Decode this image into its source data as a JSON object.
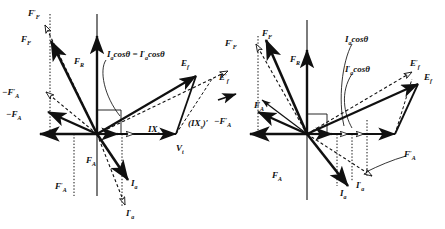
{
  "figure": {
    "type": "phasor-diagram",
    "panel_count": 2,
    "stroke_color": "#101010",
    "background_color": "#ffffff"
  },
  "left_panel": {
    "name": "left-phasor-diagram",
    "labels": {
      "f_f_prime": "F'F",
      "f_f": "FF",
      "f_r": "FR",
      "neg_f_a_prime": "−F'A",
      "neg_f_a": "−FA",
      "f_a": "FA",
      "f_a_prime": "F'A",
      "i_a": "Ia",
      "i_a_prime": "I'a",
      "e_f": "Ef",
      "e_f_prime": "E'f",
      "v_t": "Vt",
      "ix_s": "IXs",
      "ix_s_prime": "(IXs)'",
      "cos_annotation": "Ia cosθ = I'a cosθ"
    },
    "parts": {
      "F": "F",
      "F_prime": "F′",
      "R": "R",
      "A": "A",
      "I": "I",
      "a": "a",
      "E": "E",
      "V": "V",
      "t": "t",
      "X": "X",
      "s": "s",
      "prime": "′",
      "minus": "−",
      "cos": "cos",
      "theta": "θ",
      "equals": "=",
      "lparen": "(",
      "rparen": ")"
    }
  },
  "right_panel": {
    "name": "right-phasor-diagram",
    "labels": {
      "f_f_prime": "F'F",
      "f_f": "FF",
      "f_r": "FR",
      "neg_f_a_prime": "−F'A",
      "f_a_upper": "FA",
      "f_a_lower": "FA",
      "f_a_prime": "F'A",
      "i_a": "Ia",
      "i_a_prime": "I'a",
      "e_f": "Ef",
      "e_f_prime": "E'f",
      "e_f_prime_left": "E'f",
      "cos_annotation_1": "Ia cosθ",
      "cos_annotation_2": "I'a cosθ"
    }
  },
  "geometry": {
    "left_origin": [
      97,
      134
    ],
    "right_origin": [
      307,
      134
    ],
    "axis_color": "#101010",
    "dashed_style": "dashed",
    "dotted_style": "dotted"
  }
}
